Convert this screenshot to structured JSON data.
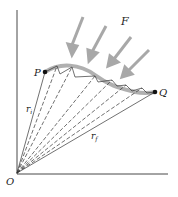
{
  "labels": {
    "force": "F",
    "start_point": "P",
    "end_point": "Q",
    "origin": "O",
    "r_initial": "r",
    "r_initial_sub": "i",
    "r_final": "r",
    "r_final_sub": "f"
  },
  "colors": {
    "arrow": "#a8a8a8",
    "path": "#b0b0b0",
    "line": "#333333",
    "point": "#111111"
  }
}
